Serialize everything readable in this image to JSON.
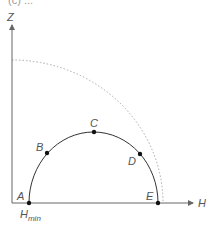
{
  "header": {
    "text": "(c) ..."
  },
  "axes": {
    "x_label": "H",
    "y_label": "Z",
    "origin_label_main": "H",
    "origin_label_sub": "min"
  },
  "points": [
    {
      "label": "A",
      "x": 29,
      "y": 203
    },
    {
      "label": "B",
      "x": 47,
      "y": 153
    },
    {
      "label": "C",
      "x": 94,
      "y": 132
    },
    {
      "label": "D",
      "x": 140,
      "y": 154
    },
    {
      "label": "E",
      "x": 158,
      "y": 203
    }
  ],
  "colors": {
    "axis": "#666666",
    "curve": "#333333",
    "dotted": "#aaaaaa",
    "point": "#111111",
    "label": "#555555"
  }
}
